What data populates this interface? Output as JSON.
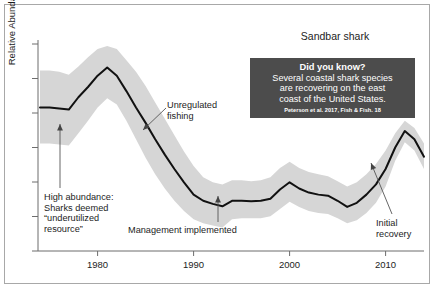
{
  "figure": {
    "title": "Sandbar shark",
    "background_color": "#ffffff",
    "border_color": "#a8a8a8"
  },
  "callout": {
    "heading": "Did you know?",
    "body": "Several coastal shark species\nare recovering on the east\ncoast of the United States.",
    "citation": "Peterson et al. 2017, Fish & Fish. 18",
    "background_color": "#4c4c4c",
    "text_color": "#ffffff"
  },
  "annotations": [
    {
      "name": "high-abundance",
      "text": "High abundance:\nSharks deemed\n“underutilized\nresource”",
      "x": 44,
      "y": 192
    },
    {
      "name": "unregulated-fishing",
      "text": "Unregulated\nfishing",
      "x": 167,
      "y": 100
    },
    {
      "name": "management-implemented",
      "text": "Management implemented",
      "x": 128,
      "y": 225
    },
    {
      "name": "initial-recovery",
      "text": "Initial\nrecovery",
      "x": 376,
      "y": 218
    }
  ],
  "chart_data": {
    "type": "line",
    "title": "Sandbar shark",
    "xlabel": "",
    "ylabel": "Relative Abundance",
    "xlim": [
      1974,
      2014
    ],
    "ylim": [
      0,
      1
    ],
    "grid": false,
    "legend": "none",
    "xticks": [
      1980,
      1990,
      2000,
      2010
    ],
    "ytick_count": 7,
    "ytick_labels": [],
    "line_color": "#111111",
    "band_color": "#d6d6d6",
    "band_label": "confidence interval",
    "x": [
      1974,
      1975,
      1976,
      1977,
      1978,
      1979,
      1980,
      1981,
      1982,
      1983,
      1984,
      1985,
      1986,
      1987,
      1988,
      1989,
      1990,
      1991,
      1992,
      1993,
      1994,
      1995,
      1996,
      1997,
      1998,
      1999,
      2000,
      2001,
      2002,
      2003,
      2004,
      2005,
      2006,
      2007,
      2008,
      2009,
      2010,
      2011,
      2012,
      2013,
      2014
    ],
    "series": [
      {
        "name": "Relative abundance (index)",
        "values": [
          0.7,
          0.7,
          0.695,
          0.69,
          0.75,
          0.8,
          0.855,
          0.895,
          0.855,
          0.78,
          0.7,
          0.625,
          0.545,
          0.47,
          0.4,
          0.335,
          0.275,
          0.245,
          0.23,
          0.218,
          0.245,
          0.245,
          0.243,
          0.245,
          0.255,
          0.3,
          0.335,
          0.305,
          0.285,
          0.275,
          0.27,
          0.245,
          0.215,
          0.235,
          0.275,
          0.325,
          0.4,
          0.505,
          0.585,
          0.545,
          0.46
        ]
      },
      {
        "name": "upper bound",
        "values": [
          0.88,
          0.88,
          0.875,
          0.86,
          0.9,
          0.945,
          0.985,
          1.0,
          0.985,
          0.93,
          0.875,
          0.805,
          0.725,
          0.645,
          0.565,
          0.485,
          0.415,
          0.36,
          0.335,
          0.325,
          0.345,
          0.345,
          0.34,
          0.345,
          0.36,
          0.405,
          0.435,
          0.405,
          0.385,
          0.375,
          0.365,
          0.34,
          0.315,
          0.335,
          0.375,
          0.425,
          0.49,
          0.575,
          0.635,
          0.6,
          0.525
        ]
      },
      {
        "name": "lower bound",
        "values": [
          0.525,
          0.525,
          0.52,
          0.515,
          0.575,
          0.635,
          0.7,
          0.745,
          0.715,
          0.635,
          0.545,
          0.455,
          0.375,
          0.305,
          0.245,
          0.195,
          0.155,
          0.135,
          0.125,
          0.115,
          0.155,
          0.16,
          0.16,
          0.16,
          0.17,
          0.205,
          0.24,
          0.215,
          0.195,
          0.185,
          0.18,
          0.16,
          0.135,
          0.15,
          0.185,
          0.235,
          0.315,
          0.44,
          0.53,
          0.49,
          0.4
        ]
      }
    ]
  }
}
